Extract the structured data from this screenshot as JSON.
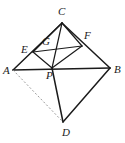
{
  "figure": {
    "canvas": {
      "width": 125,
      "height": 143
    },
    "style": {
      "stroke_color": "#1b1b1b",
      "dashed_stroke_color": "#8f8f8f",
      "background_color": "#ffffff",
      "solid_stroke_width": 1.5,
      "thin_stroke_width": 1.1,
      "dashed_stroke_width": 0.9,
      "dash_pattern": "2,2"
    },
    "points": [
      {
        "name": "A",
        "label": "A",
        "x": 13,
        "y": 70,
        "label_x": 3,
        "label_y": 65
      },
      {
        "name": "B",
        "label": "B",
        "x": 110,
        "y": 68,
        "label_x": 114,
        "label_y": 64
      },
      {
        "name": "C",
        "label": "C",
        "x": 62,
        "y": 23,
        "label_x": 58,
        "label_y": 6
      },
      {
        "name": "D",
        "label": "D",
        "x": 63,
        "y": 122,
        "label_x": 62,
        "label_y": 127
      },
      {
        "name": "E",
        "label": "E",
        "x": 33,
        "y": 52,
        "label_x": 21,
        "label_y": 44
      },
      {
        "name": "F",
        "label": "F",
        "x": 82,
        "y": 46,
        "label_x": 84,
        "label_y": 30
      },
      {
        "name": "G",
        "label": "G",
        "x": 47,
        "y": 48,
        "label_x": 42,
        "label_y": 36
      },
      {
        "name": "P",
        "label": "P",
        "x": 52,
        "y": 68,
        "label_x": 46,
        "label_y": 70
      }
    ],
    "segments": [
      {
        "name": "segment-A-C",
        "from": "A",
        "to": "C",
        "kind": "solid"
      },
      {
        "name": "segment-C-B",
        "from": "C",
        "to": "B",
        "kind": "solid"
      },
      {
        "name": "segment-B-D",
        "from": "B",
        "to": "D",
        "kind": "solid"
      },
      {
        "name": "segment-D-A-via-P",
        "from": "D",
        "to": "P",
        "kind": "solid"
      },
      {
        "name": "segment-A-B",
        "from": "A",
        "to": "B",
        "kind": "solid"
      },
      {
        "name": "segment-C-P",
        "from": "C",
        "to": "P",
        "kind": "solid"
      },
      {
        "name": "segment-E-F",
        "from": "E",
        "to": "F",
        "kind": "solid"
      },
      {
        "name": "segment-E-P",
        "from": "E",
        "to": "P",
        "kind": "solid"
      },
      {
        "name": "segment-F-P",
        "from": "F",
        "to": "P",
        "kind": "solid"
      },
      {
        "name": "segment-C-E",
        "from": "C",
        "to": "E",
        "kind": "solid"
      },
      {
        "name": "segment-C-F",
        "from": "C",
        "to": "F",
        "kind": "solid"
      },
      {
        "name": "segment-A-D-dashed",
        "from": "A",
        "to": "D",
        "kind": "dashed"
      }
    ]
  }
}
